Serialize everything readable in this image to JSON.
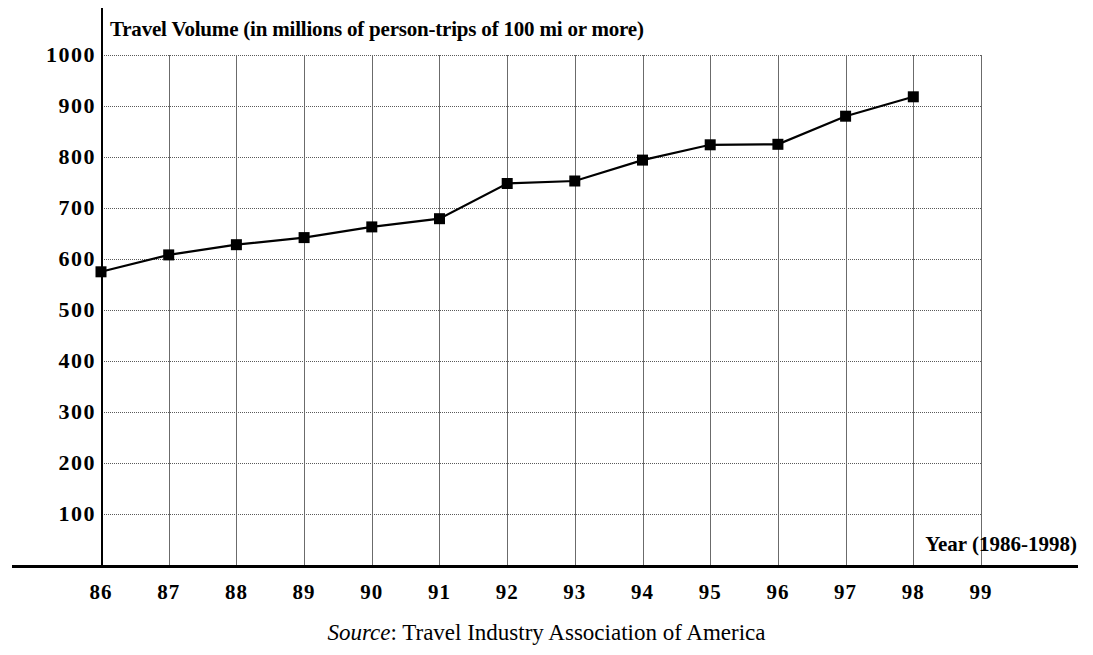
{
  "chart_data": {
    "type": "line",
    "title": "Travel Volume (in millions of person-trips of 100 mi or more)",
    "subtitle": "",
    "xlabel": "Year (1986-1998)",
    "ylabel": "Travel Volume (in millions of person-trips of 100 mi or more)",
    "source": "Travel Industry Association of America",
    "source_prefix": "Source",
    "source_separator": ": ",
    "grid": true,
    "legend": "none",
    "marker": "filled-square",
    "line_color": "#000000",
    "grid_color": "#6b6b6b",
    "axis_color": "#000000",
    "xlim": [
      86,
      99
    ],
    "ylim": [
      0,
      1000
    ],
    "x_tick_labels": [
      "86",
      "87",
      "88",
      "89",
      "90",
      "91",
      "92",
      "93",
      "94",
      "95",
      "96",
      "97",
      "98",
      "99"
    ],
    "y_tick_labels": [
      "1000",
      "900",
      "800",
      "700",
      "600",
      "500",
      "400",
      "300",
      "200",
      "100"
    ],
    "y_ticks": [
      1000,
      900,
      800,
      700,
      600,
      500,
      400,
      300,
      200,
      100
    ],
    "categories": [
      "86",
      "87",
      "88",
      "89",
      "90",
      "91",
      "92",
      "93",
      "94",
      "95",
      "96",
      "97",
      "98"
    ],
    "x": [
      86,
      87,
      88,
      89,
      90,
      91,
      92,
      93,
      94,
      95,
      96,
      97,
      98
    ],
    "values": [
      575,
      608,
      628,
      642,
      663,
      679,
      748,
      753,
      794,
      824,
      825,
      880,
      918
    ],
    "series": [
      {
        "name": "Travel volume",
        "values": [
          575,
          608,
          628,
          642,
          663,
          679,
          748,
          753,
          794,
          824,
          825,
          880,
          918
        ]
      }
    ]
  }
}
